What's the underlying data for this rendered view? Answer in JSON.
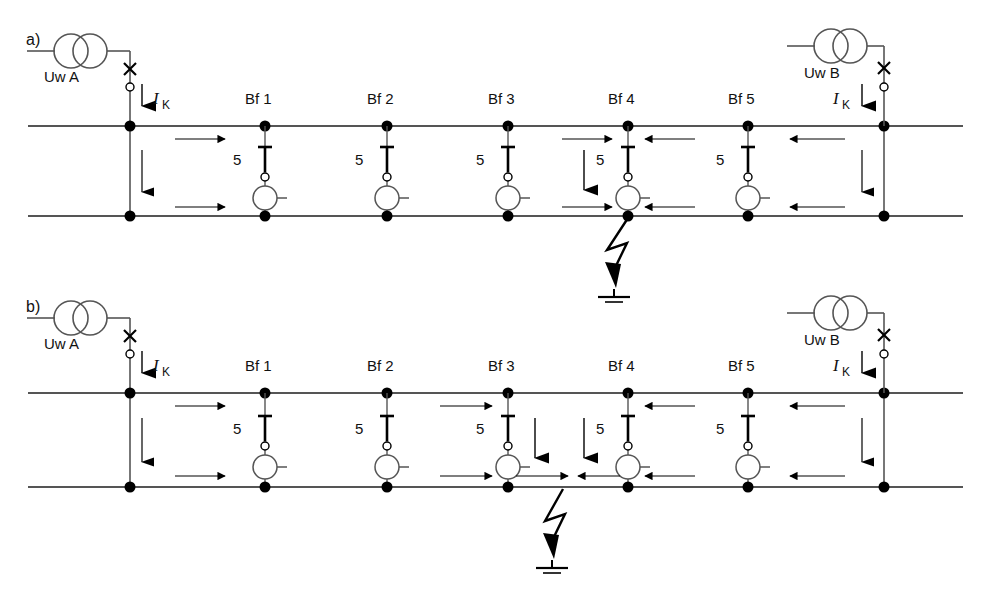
{
  "figure": {
    "type": "single-line-diagram",
    "panels": [
      {
        "id": "a",
        "label": "a)",
        "sources": [
          {
            "name": "Uw A",
            "side": "left",
            "current_label_I": "I",
            "current_label_sub": "K"
          },
          {
            "name": "Uw B",
            "side": "right",
            "current_label_I": "I",
            "current_label_sub": "K"
          }
        ],
        "feeders": [
          {
            "name": "Bf 1",
            "rating": "5"
          },
          {
            "name": "Bf 2",
            "rating": "5"
          },
          {
            "name": "Bf 3",
            "rating": "5"
          },
          {
            "name": "Bf 4",
            "rating": "5"
          },
          {
            "name": "Bf 5",
            "rating": "5"
          }
        ],
        "fault": {
          "at": "Bf 4",
          "bus": "lower",
          "symbol": "lightning-to-earth"
        },
        "feeder_with_fault_current_arrow": "Bf 4"
      },
      {
        "id": "b",
        "label": "b)",
        "sources": [
          {
            "name": "Uw A",
            "side": "left",
            "current_label_I": "I",
            "current_label_sub": "K"
          },
          {
            "name": "Uw B",
            "side": "right",
            "current_label_I": "I",
            "current_label_sub": "K"
          }
        ],
        "feeders": [
          {
            "name": "Bf 1",
            "rating": "5"
          },
          {
            "name": "Bf 2",
            "rating": "5"
          },
          {
            "name": "Bf 3",
            "rating": "5"
          },
          {
            "name": "Bf 4",
            "rating": "5"
          },
          {
            "name": "Bf 5",
            "rating": "5"
          }
        ],
        "fault": {
          "at": "between Bf 3 and Bf 4",
          "bus": "lower",
          "symbol": "lightning-to-earth"
        },
        "feeder_with_fault_current_arrow": "Bf 3, Bf 4"
      }
    ],
    "colors": {
      "line": "#555555",
      "symbol": "#000000",
      "text": "#111111",
      "background": "#ffffff"
    }
  },
  "panel_a": {
    "label": "a)",
    "uw_a": "Uw A",
    "uw_b": "Uw B",
    "ik_left_i": "I",
    "ik_left_k": "K",
    "ik_right_i": "I",
    "ik_right_k": "K",
    "bf1": "Bf 1",
    "bf2": "Bf 2",
    "bf3": "Bf 3",
    "bf4": "Bf 4",
    "bf5": "Bf 5",
    "n1": "5",
    "n2": "5",
    "n3": "5",
    "n4": "5",
    "n5": "5"
  },
  "panel_b": {
    "label": "b)",
    "uw_a": "Uw A",
    "uw_b": "Uw B",
    "ik_left_i": "I",
    "ik_left_k": "K",
    "ik_right_i": "I",
    "ik_right_k": "K",
    "bf1": "Bf 1",
    "bf2": "Bf 2",
    "bf3": "Bf 3",
    "bf4": "Bf 4",
    "bf5": "Bf 5",
    "n1": "5",
    "n2": "5",
    "n3": "5",
    "n4": "5",
    "n5": "5"
  }
}
